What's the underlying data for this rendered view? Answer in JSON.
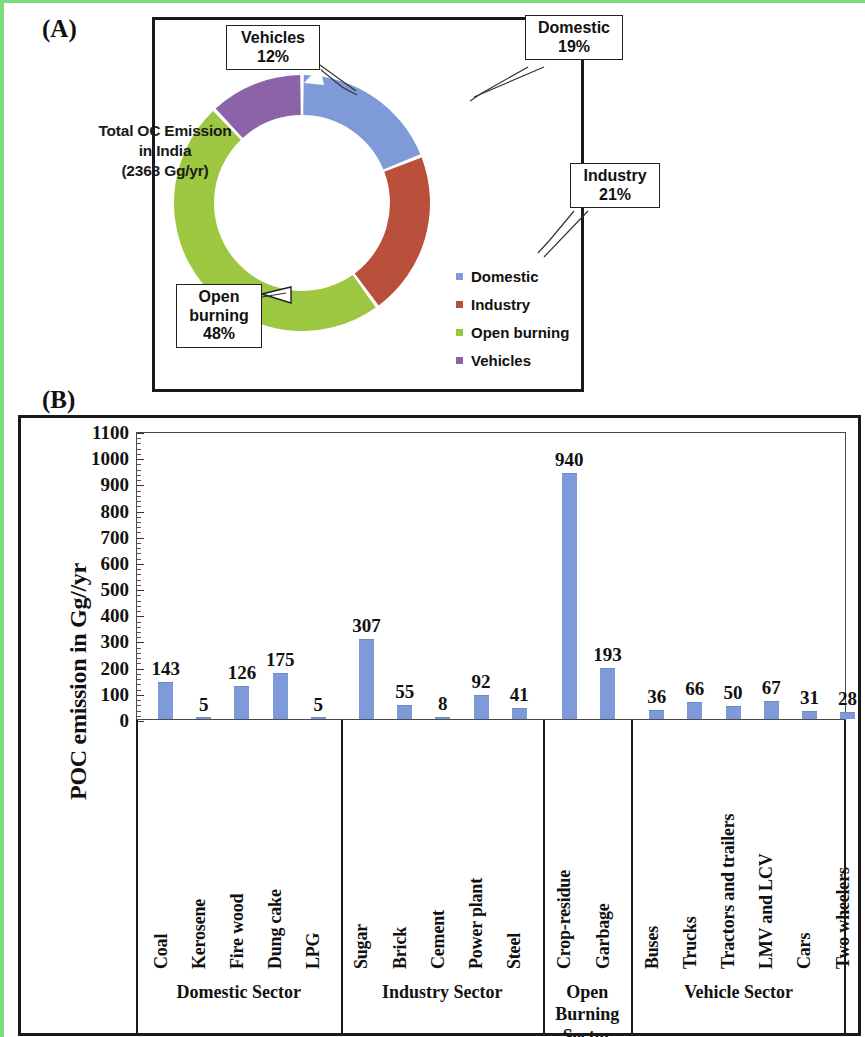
{
  "panels": {
    "a_label": "(A)",
    "b_label": "(B)"
  },
  "donut": {
    "center_line1": "Total OC Emission",
    "center_line2": "in India",
    "center_line3": "(2368 Gg/yr)",
    "callouts": [
      {
        "name": "Vehicles",
        "line1": "Vehicles",
        "line2": "12%"
      },
      {
        "name": "Domestic",
        "line1": "Domestic",
        "line2": "19%"
      },
      {
        "name": "Industry",
        "line1": "Industry",
        "line2": "21%"
      },
      {
        "name": "Open burning",
        "line1": "Open",
        "line2": "burning",
        "line3": "48%"
      }
    ],
    "legend": [
      {
        "label": "Domestic",
        "color": "#7e9ad9"
      },
      {
        "label": "Industry",
        "color": "#b8503c"
      },
      {
        "label": "Open burning",
        "color": "#9dc641"
      },
      {
        "label": "Vehicles",
        "color": "#8c63a8"
      }
    ]
  },
  "chart_data": [
    {
      "type": "pie",
      "title": "Total OC Emission in India (2368 Gg/yr)",
      "subtitle": "",
      "total": 2368,
      "units": "Gg/yr",
      "labels": [
        "Domestic",
        "Industry",
        "Open burning",
        "Vehicles"
      ],
      "values": [
        19,
        21,
        48,
        12
      ],
      "colors": [
        "#7e9ad9",
        "#b8503c",
        "#9dc641",
        "#8c63a8"
      ],
      "legend_position": "right",
      "donut": true,
      "start_angle_deg": 0
    },
    {
      "type": "bar",
      "title": "",
      "xlabel": "",
      "ylabel": "POC emission in Gg//yr",
      "ylim": [
        0,
        1100
      ],
      "yticks": [
        0,
        100,
        200,
        300,
        400,
        500,
        600,
        700,
        800,
        900,
        1000,
        1100
      ],
      "grid": false,
      "bar_color": "#7e9ad9",
      "categories": [
        "Coal",
        "Kerosene",
        "Fire wood",
        "Dung cake",
        "LPG",
        "Sugar",
        "Brick",
        "Cement",
        "Power plant",
        "Steel",
        "Crop-residue",
        "Garbage",
        "Buses",
        "Trucks",
        "Tractors and trailers",
        "LMV and LCV",
        "Cars",
        "Two wheelers"
      ],
      "values": [
        143,
        5,
        126,
        175,
        5,
        307,
        55,
        8,
        92,
        41,
        940,
        193,
        36,
        66,
        50,
        67,
        31,
        28
      ],
      "groups": [
        {
          "label": "Domestic Sector",
          "start": 0,
          "end": 4
        },
        {
          "label": "Industry Sector",
          "start": 5,
          "end": 9
        },
        {
          "label": "Open Burning Sector",
          "start": 10,
          "end": 11
        },
        {
          "label": "Vehicle Sector",
          "start": 12,
          "end": 17
        }
      ]
    }
  ],
  "bar_sectors": [
    {
      "label": "Domestic Sector",
      "lines": [
        "Domestic Sector"
      ]
    },
    {
      "label": "Industry Sector",
      "lines": [
        "Industry Sector"
      ]
    },
    {
      "label": "Open Burning Sector",
      "lines": [
        "Open",
        "Burning",
        "Sector"
      ]
    },
    {
      "label": "Vehicle Sector",
      "lines": [
        "Vehicle Sector"
      ]
    }
  ]
}
